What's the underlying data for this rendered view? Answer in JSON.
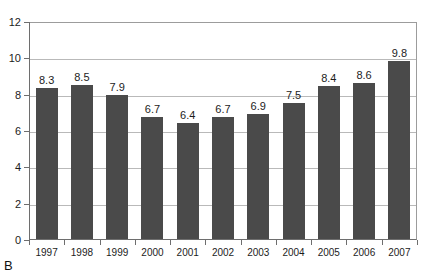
{
  "figure": {
    "panel_label": "B",
    "top_cutoff_text": "—"
  },
  "chart_data": {
    "type": "bar",
    "title": "",
    "subtitle": "",
    "xlabel": "",
    "ylabel": "",
    "categories": [
      "1997",
      "1998",
      "1999",
      "2000",
      "2001",
      "2002",
      "2003",
      "2004",
      "2005",
      "2006",
      "2007"
    ],
    "values": [
      8.3,
      8.5,
      7.9,
      6.7,
      6.4,
      6.7,
      6.9,
      7.5,
      8.4,
      8.6,
      9.8
    ],
    "data_labels": [
      "8.3",
      "8.5",
      "7.9",
      "6.7",
      "6.4",
      "6.7",
      "6.9",
      "7.5",
      "8.4",
      "8.6",
      "9.8"
    ],
    "ylim": [
      0,
      12
    ],
    "ytick_values": [
      0,
      2,
      4,
      6,
      8,
      10,
      12
    ],
    "ytick_labels": [
      "0",
      "2",
      "4",
      "6",
      "8",
      "10",
      "12"
    ],
    "grid": true,
    "grid_axis": "y",
    "legend": false,
    "legend_position": "none",
    "bar_color": "#4a4a4a",
    "axis_color": "#6e6e6e",
    "gridline_color": "#b9b9b9",
    "background_color": "#ffffff"
  }
}
